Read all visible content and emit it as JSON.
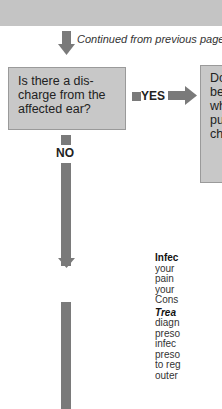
{
  "header": {
    "continued_text": "Continued from previous page"
  },
  "question": {
    "lines": [
      "Is there a dis-",
      "charge from the",
      "affected ear?"
    ]
  },
  "branches": {
    "yes_label": "YES",
    "no_label": "NO"
  },
  "answer_box": {
    "lines": [
      "Do",
      "be",
      "wh",
      "pu",
      "ch"
    ]
  },
  "info": {
    "title": "Infec",
    "body_lines": [
      "your",
      "pain",
      "your",
      "Cons"
    ],
    "treatment_label": "Trea",
    "treatment_lines": [
      "diagn",
      "preso",
      "infec",
      "preso",
      "to reg",
      "outer"
    ]
  },
  "colors": {
    "band": "#c4c4c4",
    "box_fill": "#c8c8c8",
    "arrow": "#7a7a7a"
  }
}
